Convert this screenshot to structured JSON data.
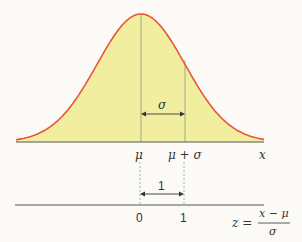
{
  "colors": {
    "curve": "#e8553a",
    "fill": "#f2eea0",
    "axis": "#555555",
    "guide": "#888888",
    "background": "#fbfaf6"
  },
  "normal_curve": {
    "mean_label": "μ",
    "mean_plus_sigma_label": "μ + σ",
    "sigma_label": "σ",
    "axis_label": "x"
  },
  "standard_axis": {
    "zero_label": "0",
    "one_label": "1",
    "unit_label": "1",
    "formula_lhs": "z =",
    "formula_numerator": "x − μ",
    "formula_denominator": "σ"
  },
  "chart_data": {
    "type": "line",
    "title": "",
    "x_axis_ticks": [
      "μ",
      "μ + σ"
    ],
    "x_axis_label": "x",
    "z_axis_ticks": [
      "0",
      "1"
    ],
    "z_axis_label": "z = (x − μ) / σ",
    "annotations": [
      "σ (width between μ and μ + σ)",
      "1 (width between 0 and 1)"
    ]
  }
}
